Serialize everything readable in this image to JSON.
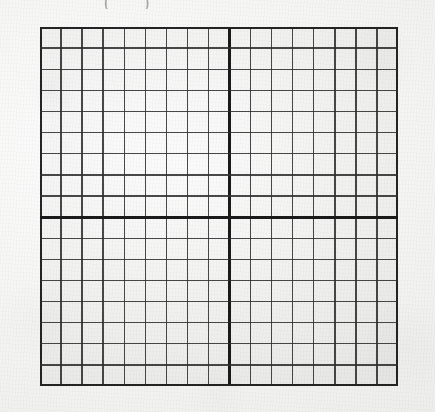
{
  "document": {
    "kind": "scanned-worksheet-coordinate-grid",
    "background_color": "#f4f4f3",
    "ink_color": "#2f2f2f",
    "axis_color": "#1a1a1a"
  },
  "top_mark": {
    "text": "( )",
    "note": "faint partially cropped mark along the top edge"
  },
  "grid": {
    "label": "Cartesian coordinate grid",
    "left": 40,
    "top": 27,
    "width": 358,
    "height": 359,
    "columns": 17,
    "rows": 17,
    "cell_width": 21.06,
    "cell_height": 21.12,
    "axis_column_index": 9,
    "axis_row_index": 9,
    "origin_x": 229.5,
    "origin_y": 217.1,
    "minor_line_width": 1.4,
    "axis_line_width": 3.0,
    "border_line_width": 2.1
  },
  "chart_data": {
    "type": "scatter",
    "title": "",
    "subtitle": "",
    "xlabel": "",
    "ylabel": "",
    "series": [],
    "x": [],
    "values": [],
    "categories": [],
    "xlim": [
      -9,
      8
    ],
    "ylim": [
      -8,
      9
    ],
    "xticks": [
      -9,
      -8,
      -7,
      -6,
      -5,
      -4,
      -3,
      -2,
      -1,
      0,
      1,
      2,
      3,
      4,
      5,
      6,
      7,
      8
    ],
    "yticks": [
      -8,
      -7,
      -6,
      -5,
      -4,
      -3,
      -2,
      -1,
      0,
      1,
      2,
      3,
      4,
      5,
      6,
      7,
      8,
      9
    ],
    "xtick_labels": [],
    "ytick_labels": [],
    "grid": true,
    "grid_squares_x": 17,
    "grid_squares_y": 17,
    "legend": [],
    "legend_position": "none",
    "annotations": [],
    "note": "Empty printed graph paper: 17x17 unit squares with bold x-axis and y-axis crossing 9 squares in from the left and 9 squares down from the top. No plotted data, no tick labels."
  }
}
